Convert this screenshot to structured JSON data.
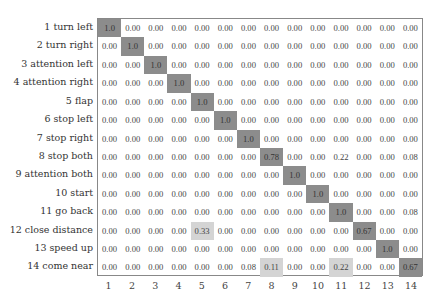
{
  "chart_data": {
    "type": "heatmap",
    "title": "",
    "xlabel": "",
    "ylabel": "",
    "row_labels": [
      "1 turn left",
      "2 turn right",
      "3 attention left",
      "4 attention right",
      "5 flap",
      "6 stop left",
      "7 stop right",
      "8 stop both",
      "9 attention both",
      "10 start",
      "11 go back",
      "12 close distance",
      "13 speed up",
      "14 come near"
    ],
    "col_labels": [
      "1",
      "2",
      "3",
      "4",
      "5",
      "6",
      "7",
      "8",
      "9",
      "10",
      "11",
      "12",
      "13",
      "14"
    ],
    "values": [
      [
        "1.0",
        "0.00",
        "0.00",
        "0.00",
        "0.00",
        "0.00",
        "0.00",
        "0.00",
        "0.00",
        "0.00",
        "0.00",
        "0.00",
        "0.00",
        "0.00"
      ],
      [
        "0.00",
        "1.0",
        "0.00",
        "0.00",
        "0.00",
        "0.00",
        "0.00",
        "0.00",
        "0.00",
        "0.00",
        "0.00",
        "0.00",
        "0.00",
        "0.00"
      ],
      [
        "0.00",
        "0.00",
        "1.0",
        "0.00",
        "0.00",
        "0.00",
        "0.00",
        "0.00",
        "0.00",
        "0.00",
        "0.00",
        "0.00",
        "0.00",
        "0.00"
      ],
      [
        "0.00",
        "0.00",
        "0.00",
        "1.0",
        "0.00",
        "0.00",
        "0.00",
        "0.00",
        "0.00",
        "0.00",
        "0.00",
        "0.00",
        "0.00",
        "0.00"
      ],
      [
        "0.00",
        "0.00",
        "0.00",
        "0.00",
        "1.0",
        "0.00",
        "0.00",
        "0.00",
        "0.00",
        "0.00",
        "0.00",
        "0.00",
        "0.00",
        "0.00"
      ],
      [
        "0.00",
        "0.00",
        "0.00",
        "0.00",
        "0.00",
        "1.0",
        "0.00",
        "0.00",
        "0.00",
        "0.00",
        "0.00",
        "0.00",
        "0.00",
        "0.00"
      ],
      [
        "0.00",
        "0.00",
        "0.00",
        "0.00",
        "0.00",
        "0.00",
        "1.0",
        "0.00",
        "0.00",
        "0.00",
        "0.00",
        "0.00",
        "0.00",
        "0.00"
      ],
      [
        "0.00",
        "0.00",
        "0.00",
        "0.00",
        "0.00",
        "0.00",
        "0.00",
        "0.78",
        "0.00",
        "0.00",
        "0.22",
        "0.00",
        "0.00",
        "0.08"
      ],
      [
        "0.00",
        "0.00",
        "0.00",
        "0.00",
        "0.00",
        "0.00",
        "0.00",
        "0.00",
        "1.0",
        "0.00",
        "0.00",
        "0.00",
        "0.00",
        "0.00"
      ],
      [
        "0.00",
        "0.00",
        "0.00",
        "0.00",
        "0.00",
        "0.00",
        "0.00",
        "0.00",
        "0.00",
        "1.0",
        "0.00",
        "0.00",
        "0.00",
        "0.00"
      ],
      [
        "0.00",
        "0.00",
        "0.00",
        "0.00",
        "0.00",
        "0.00",
        "0.00",
        "0.00",
        "0.00",
        "0.00",
        "1.0",
        "0.00",
        "0.00",
        "0.08"
      ],
      [
        "0.00",
        "0.00",
        "0.00",
        "0.00",
        "0.33",
        "0.00",
        "0.00",
        "0.00",
        "0.00",
        "0.00",
        "0.00",
        "0.67",
        "0.00",
        "0.00"
      ],
      [
        "0.00",
        "0.00",
        "0.00",
        "0.00",
        "0.00",
        "0.00",
        "0.00",
        "0.00",
        "0.00",
        "0.00",
        "0.00",
        "0.00",
        "1.0",
        "0.00"
      ],
      [
        "0.00",
        "0.00",
        "0.00",
        "0.00",
        "0.00",
        "0.00",
        "0.08",
        "0.11",
        "0.00",
        "0.00",
        "0.22",
        "0.00",
        "0.00",
        "0.67"
      ]
    ],
    "shading": {
      "high": "#8c8c8c",
      "low": "#d4d4d4",
      "none": "#ffffff",
      "high_threshold": 0.5,
      "low_cells": [
        [
          11,
          4
        ],
        [
          13,
          7
        ],
        [
          13,
          10
        ]
      ]
    },
    "grid": false,
    "legend": null
  }
}
